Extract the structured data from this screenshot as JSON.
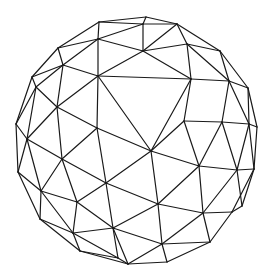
{
  "figure": {
    "title": "Geodesic sphere wireframe",
    "stroke_color": "#1a1a1a",
    "background": "#ffffff"
  },
  "vertices": {
    "A": [
      146,
      17
    ],
    "B": [
      99,
      22
    ],
    "C": [
      143,
      24
    ],
    "D": [
      177,
      24
    ],
    "E": [
      98,
      39
    ],
    "F": [
      58,
      48
    ],
    "G": [
      143,
      51
    ],
    "H": [
      187,
      44
    ],
    "I": [
      220,
      51
    ],
    "J": [
      63,
      65
    ],
    "K": [
      98,
      76
    ],
    "L": [
      32,
      77
    ],
    "M": [
      36,
      87
    ],
    "N": [
      191,
      79
    ],
    "O": [
      229,
      81
    ],
    "P": [
      248,
      88
    ],
    "Q": [
      57,
      107
    ],
    "R": [
      97,
      128
    ],
    "S": [
      16,
      124
    ],
    "T": [
      27,
      139
    ],
    "U": [
      184,
      121
    ],
    "V": [
      222,
      122
    ],
    "W": [
      249,
      124
    ],
    "X": [
      257,
      127
    ],
    "Y": [
      151,
      151
    ],
    "Z": [
      62,
      159
    ],
    "a": [
      18,
      172
    ],
    "b": [
      106,
      183
    ],
    "c": [
      199,
      166
    ],
    "d": [
      237,
      170
    ],
    "e": [
      254,
      169
    ],
    "f": [
      41,
      191
    ],
    "g": [
      77,
      202
    ],
    "h": [
      158,
      204
    ],
    "i": [
      203,
      213
    ],
    "j": [
      232,
      212
    ],
    "k": [
      242,
      206
    ],
    "l": [
      40,
      219
    ],
    "m": [
      113,
      228
    ],
    "n": [
      73,
      233
    ],
    "o": [
      162,
      244
    ],
    "p": [
      210,
      242
    ],
    "q": [
      80,
      251
    ],
    "r": [
      118,
      258
    ],
    "s": [
      128,
      264
    ],
    "t": [
      167,
      262
    ]
  },
  "edges": [
    [
      "A",
      "B"
    ],
    [
      "A",
      "C"
    ],
    [
      "A",
      "D"
    ],
    [
      "B",
      "C"
    ],
    [
      "C",
      "D"
    ],
    [
      "B",
      "E"
    ],
    [
      "C",
      "E"
    ],
    [
      "C",
      "G"
    ],
    [
      "D",
      "G"
    ],
    [
      "D",
      "H"
    ],
    [
      "D",
      "I"
    ],
    [
      "B",
      "F"
    ],
    [
      "E",
      "F"
    ],
    [
      "E",
      "G"
    ],
    [
      "E",
      "J"
    ],
    [
      "E",
      "K"
    ],
    [
      "F",
      "J"
    ],
    [
      "F",
      "L"
    ],
    [
      "G",
      "K"
    ],
    [
      "G",
      "H"
    ],
    [
      "G",
      "N"
    ],
    [
      "H",
      "I"
    ],
    [
      "H",
      "N"
    ],
    [
      "I",
      "O"
    ],
    [
      "I",
      "P"
    ],
    [
      "H",
      "O"
    ],
    [
      "J",
      "K"
    ],
    [
      "J",
      "L"
    ],
    [
      "J",
      "M"
    ],
    [
      "J",
      "Q"
    ],
    [
      "L",
      "M"
    ],
    [
      "L",
      "S"
    ],
    [
      "K",
      "N"
    ],
    [
      "K",
      "Q"
    ],
    [
      "K",
      "R"
    ],
    [
      "K",
      "Y"
    ],
    [
      "N",
      "O"
    ],
    [
      "N",
      "U"
    ],
    [
      "N",
      "Y"
    ],
    [
      "O",
      "P"
    ],
    [
      "O",
      "V"
    ],
    [
      "O",
      "W"
    ],
    [
      "P",
      "X"
    ],
    [
      "P",
      "W"
    ],
    [
      "M",
      "Q"
    ],
    [
      "M",
      "T"
    ],
    [
      "M",
      "S"
    ],
    [
      "Q",
      "R"
    ],
    [
      "Q",
      "T"
    ],
    [
      "Q",
      "Z"
    ],
    [
      "S",
      "T"
    ],
    [
      "S",
      "a"
    ],
    [
      "T",
      "Z"
    ],
    [
      "T",
      "a"
    ],
    [
      "T",
      "f"
    ],
    [
      "R",
      "Y"
    ],
    [
      "R",
      "Z"
    ],
    [
      "R",
      "b"
    ],
    [
      "U",
      "V"
    ],
    [
      "U",
      "Y"
    ],
    [
      "U",
      "c"
    ],
    [
      "V",
      "W"
    ],
    [
      "V",
      "c"
    ],
    [
      "V",
      "d"
    ],
    [
      "W",
      "X"
    ],
    [
      "W",
      "d"
    ],
    [
      "X",
      "e"
    ],
    [
      "W",
      "e"
    ],
    [
      "Y",
      "b"
    ],
    [
      "Y",
      "c"
    ],
    [
      "Y",
      "h"
    ],
    [
      "Z",
      "b"
    ],
    [
      "Z",
      "f"
    ],
    [
      "Z",
      "g"
    ],
    [
      "a",
      "f"
    ],
    [
      "a",
      "l"
    ],
    [
      "b",
      "g"
    ],
    [
      "b",
      "m"
    ],
    [
      "b",
      "h"
    ],
    [
      "c",
      "d"
    ],
    [
      "c",
      "h"
    ],
    [
      "c",
      "i"
    ],
    [
      "d",
      "e"
    ],
    [
      "d",
      "i"
    ],
    [
      "d",
      "k"
    ],
    [
      "e",
      "k"
    ],
    [
      "e",
      "j"
    ],
    [
      "f",
      "g"
    ],
    [
      "f",
      "l"
    ],
    [
      "f",
      "n"
    ],
    [
      "g",
      "m"
    ],
    [
      "g",
      "n"
    ],
    [
      "h",
      "i"
    ],
    [
      "h",
      "m"
    ],
    [
      "h",
      "o"
    ],
    [
      "i",
      "j"
    ],
    [
      "i",
      "o"
    ],
    [
      "i",
      "p"
    ],
    [
      "j",
      "k"
    ],
    [
      "j",
      "p"
    ],
    [
      "l",
      "n"
    ],
    [
      "l",
      "q"
    ],
    [
      "m",
      "n"
    ],
    [
      "m",
      "o"
    ],
    [
      "m",
      "r"
    ],
    [
      "m",
      "s"
    ],
    [
      "n",
      "q"
    ],
    [
      "n",
      "r"
    ],
    [
      "o",
      "p"
    ],
    [
      "o",
      "t"
    ],
    [
      "o",
      "s"
    ],
    [
      "p",
      "t"
    ],
    [
      "q",
      "r"
    ],
    [
      "q",
      "s"
    ],
    [
      "r",
      "s"
    ],
    [
      "s",
      "t"
    ]
  ]
}
